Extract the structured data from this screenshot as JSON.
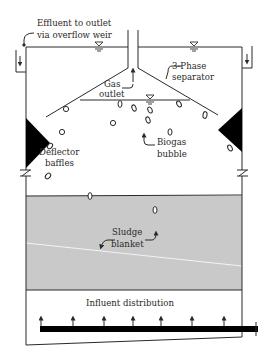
{
  "diagram": {
    "type": "UASB reactor schematic",
    "colors": {
      "line": "#2a2a2a",
      "sludge_fill": "#c9c9c9",
      "baffle_fill": "#000000",
      "background": "#ffffff",
      "sludge_boundary": "#f2f2f2"
    },
    "labels": {
      "effluent_line1": "Effluent to outlet",
      "effluent_line2": "via overflow weir",
      "gas_line1": "Gas",
      "gas_line2": "outlet",
      "separator_line1": "3-Phase",
      "separator_line2": "separator",
      "deflector_line1": "Deflector",
      "deflector_line2": "baffles",
      "biogas_line1": "Biogas",
      "biogas_line2": "bubble",
      "sludge_line1": "Sludge",
      "sludge_line2": "blanket",
      "influent": "Influent distribution"
    },
    "components": [
      "overflow-weir-left",
      "overflow-weir-right",
      "gas-outlet-pipe",
      "three-phase-separator",
      "deflector-baffle-left",
      "deflector-baffle-right",
      "biogas-bubbles",
      "sludge-blanket",
      "influent-distribution-pipe"
    ],
    "influent_nozzle_count": 7
  }
}
